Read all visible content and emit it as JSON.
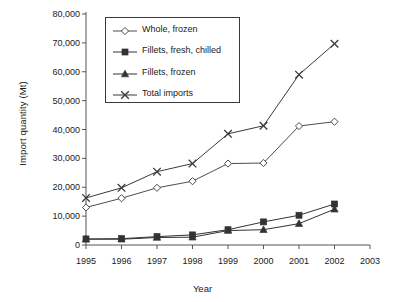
{
  "chart_data": {
    "type": "line",
    "title": "",
    "xlabel": "Year",
    "ylabel": "Import quantity (Mt)",
    "x": [
      1995,
      1996,
      1997,
      1998,
      1999,
      2000,
      2001,
      2002
    ],
    "xtick_labels": [
      "1995",
      "1996",
      "1997",
      "1998",
      "1999",
      "2000",
      "2001",
      "2002",
      "2003"
    ],
    "xlim": [
      1995,
      2003
    ],
    "ytick_labels": [
      "0",
      "10,000",
      "20,000",
      "30,000",
      "40,000",
      "50,000",
      "60,000",
      "70,000",
      "80,000"
    ],
    "ytick_values": [
      0,
      10000,
      20000,
      30000,
      40000,
      50000,
      60000,
      70000,
      80000
    ],
    "ylim": [
      0,
      80000
    ],
    "grid": false,
    "legend_position": "upper-left-inside",
    "series": [
      {
        "name": "Whole, frozen",
        "marker": "open-diamond",
        "color": "#4d4d4d",
        "values": [
          13000,
          16200,
          19800,
          22100,
          28200,
          28400,
          41200,
          42700
        ]
      },
      {
        "name": "Fillets, fresh, chilled",
        "marker": "filled-square",
        "color": "#333333",
        "values": [
          2100,
          2200,
          2900,
          3500,
          5300,
          8000,
          10300,
          14200
        ]
      },
      {
        "name": "Fillets, frozen",
        "marker": "filled-triangle",
        "color": "#333333",
        "values": [
          2000,
          2000,
          2600,
          2700,
          5000,
          5300,
          7400,
          12400
        ]
      },
      {
        "name": "Total imports",
        "marker": "cross-x",
        "color": "#3a3a3a",
        "values": [
          16300,
          19800,
          25400,
          28200,
          38500,
          41300,
          59000,
          69700
        ]
      }
    ]
  },
  "legend": {
    "items": [
      {
        "label": "Whole, frozen",
        "marker": "open-diamond"
      },
      {
        "label": "Fillets, fresh, chilled",
        "marker": "filled-square"
      },
      {
        "label": "Fillets, frozen",
        "marker": "filled-triangle"
      },
      {
        "label": "Total imports",
        "marker": "cross-x"
      }
    ]
  }
}
